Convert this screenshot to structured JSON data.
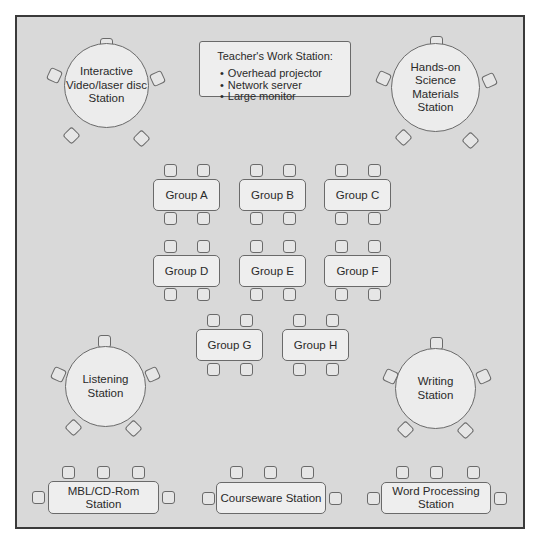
{
  "diagram": {
    "colors": {
      "background": "#d9d9d9",
      "furniture_fill": "#eeeeee",
      "outline": "#6a6a6a",
      "frame": "#3a3a3a",
      "text": "#2a2a2a"
    },
    "teacher_station": {
      "title": "Teacher's Work Station:",
      "items": [
        "Overhead projector",
        "Network server",
        "Large monitor"
      ]
    },
    "round_stations": [
      {
        "id": "interactive",
        "lines": [
          "Interactive",
          "Video/laser disc",
          "Station"
        ],
        "chairs": 5
      },
      {
        "id": "hands-on",
        "lines": [
          "Hands-on Science",
          "Materials",
          "Station"
        ],
        "chairs": 5
      },
      {
        "id": "listening",
        "lines": [
          "Listening",
          "Station"
        ],
        "chairs": 5
      },
      {
        "id": "writing",
        "lines": [
          "Writing",
          "Station"
        ],
        "chairs": 5
      }
    ],
    "group_tables": [
      {
        "label": "Group A",
        "chairs": 4
      },
      {
        "label": "Group B",
        "chairs": 4
      },
      {
        "label": "Group C",
        "chairs": 4
      },
      {
        "label": "Group D",
        "chairs": 4
      },
      {
        "label": "Group E",
        "chairs": 4
      },
      {
        "label": "Group F",
        "chairs": 4
      },
      {
        "label": "Group G",
        "chairs": 4
      },
      {
        "label": "Group H",
        "chairs": 4
      }
    ],
    "computer_stations": [
      {
        "lines": [
          "MBL/CD-Rom Station"
        ],
        "chairs": 5
      },
      {
        "lines": [
          "Courseware Station"
        ],
        "chairs": 5
      },
      {
        "lines": [
          "Word Processing",
          "Station"
        ],
        "chairs": 5
      }
    ]
  }
}
